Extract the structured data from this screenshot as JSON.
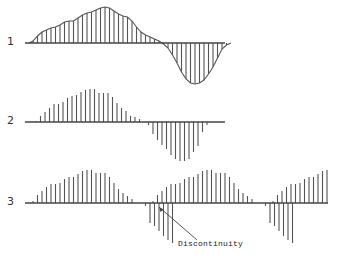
{
  "diagram": {
    "rows": [
      {
        "label": "1",
        "kind": "continuous-hatched",
        "baseline_y": 43,
        "x_start": 25,
        "x_end": 225,
        "stem_spacing": 4.5,
        "stem_x0": 33,
        "amplitudes": [
          2,
          7,
          11,
          13,
          15,
          16,
          18,
          21,
          22,
          22,
          25,
          28,
          30,
          31,
          33,
          35,
          36,
          35,
          32,
          29,
          27,
          26,
          22,
          16,
          11,
          8,
          6,
          4,
          2,
          -1,
          -5,
          -12,
          -20,
          -29,
          -36,
          -40,
          -41,
          -40,
          -37,
          -31,
          -24,
          -15,
          -6,
          -2
        ]
      },
      {
        "label": "2",
        "kind": "sampled-stems",
        "baseline_y": 122,
        "x_start": 25,
        "x_end": 225,
        "stem_spacing": 4.5,
        "stem_x0": 36,
        "amplitudes": [
          1,
          6,
          10,
          14,
          18,
          18,
          20,
          24,
          26,
          27,
          30,
          32,
          33,
          33,
          29,
          29,
          29,
          25,
          19,
          14,
          11,
          6,
          5,
          3,
          0,
          -3,
          -12,
          -18,
          -23,
          -27,
          -33,
          -37,
          -39,
          -39,
          -37,
          -30,
          -24,
          -10,
          -3
        ]
      },
      {
        "label": "3",
        "kind": "sampled-stems-periodic",
        "baseline_y": 203,
        "x_start": 25,
        "x_end": 328,
        "stem_spacing": 4.5,
        "segment_starts_x": [
          33,
          153,
          273
        ],
        "segment_amplitudes": [
          2,
          8,
          12,
          16,
          19,
          19,
          20,
          24,
          26,
          26,
          29,
          32,
          33,
          33,
          30,
          30,
          30,
          26,
          20,
          14,
          10,
          7,
          4,
          0,
          0,
          -3,
          -20,
          -23,
          -28,
          -33,
          -37,
          -40
        ],
        "last_segment_visible_count": 13
      }
    ],
    "annotation": {
      "text": "Discontinuity",
      "text_x": 178,
      "text_y": 245,
      "arrow_from": [
        197,
        240
      ],
      "arrow_to": [
        159,
        207
      ]
    },
    "colors": {
      "stroke": "#555555",
      "baseline": "#444444",
      "fill_background": "#ffffff"
    }
  }
}
